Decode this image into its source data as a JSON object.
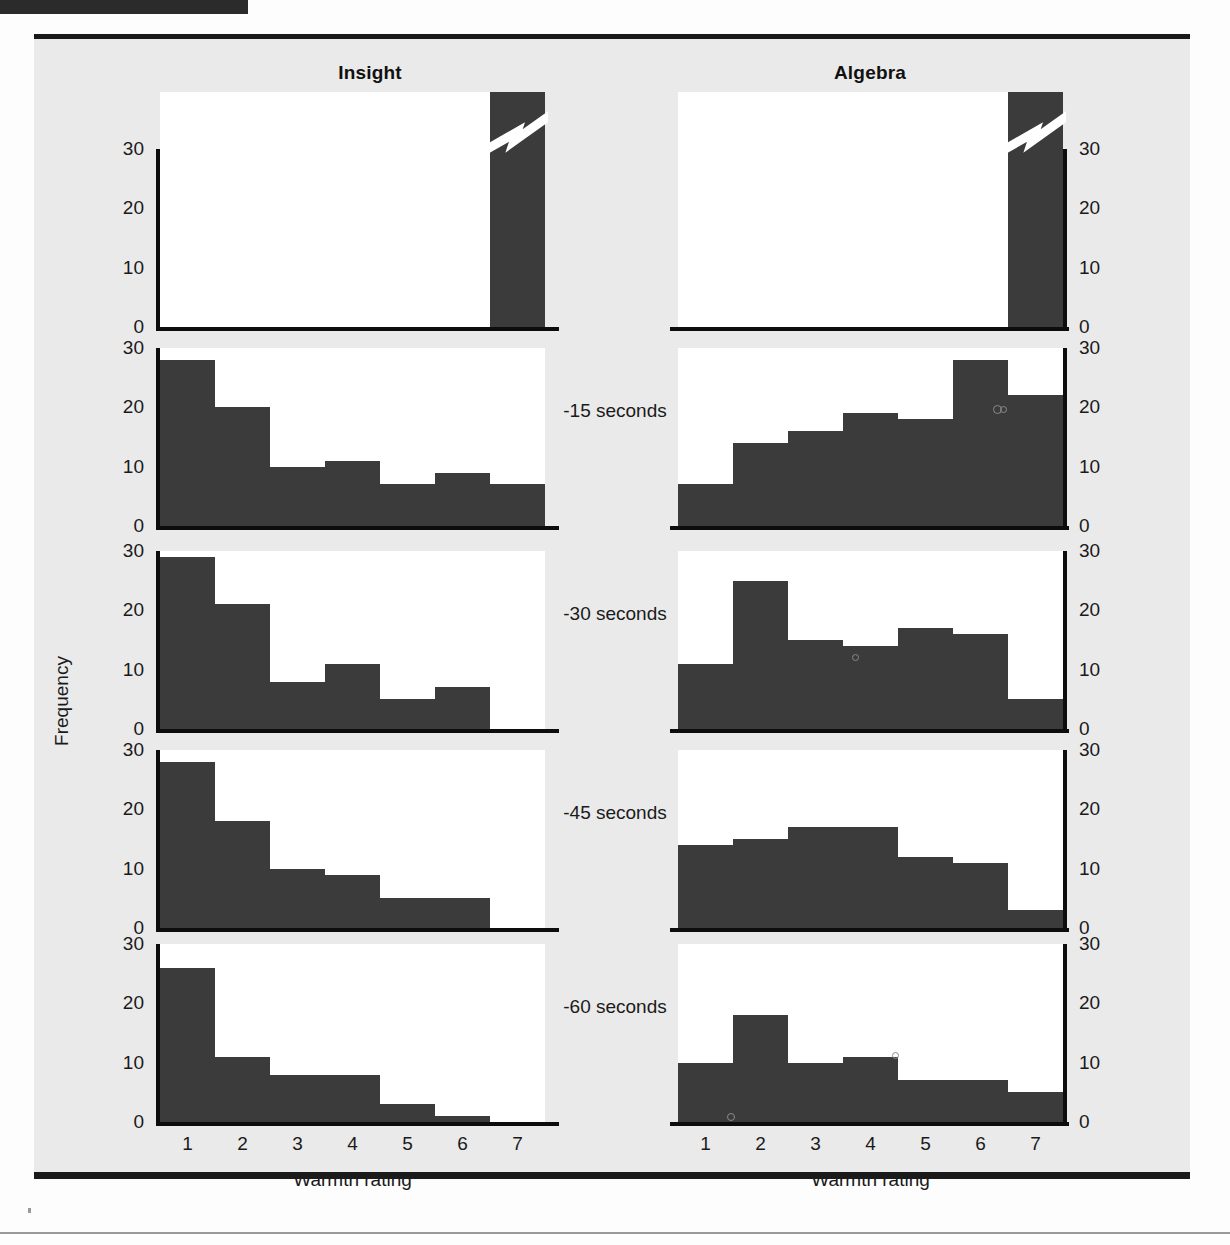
{
  "figure": {
    "columns": [
      "Insight",
      "Algebra"
    ],
    "y_axis_label": "Frequency",
    "x_axis_label": "Warmth rating",
    "x_ticks": [
      "1",
      "2",
      "3",
      "4",
      "5",
      "6",
      "7"
    ],
    "y_ticks": [
      "0",
      "10",
      "20",
      "30"
    ],
    "row_labels": [
      "",
      "-15 seconds",
      "-30 seconds",
      "-45 seconds",
      "-60 seconds"
    ],
    "bar_color": "#3b3b3b",
    "axis_color": "#0d0d0d",
    "background_color": "#eaeaea",
    "panel_color": "#ffffff"
  },
  "chart_data": {
    "type": "bar",
    "title": "",
    "xlabel": "Warmth rating",
    "ylabel": "Frequency",
    "categories": [
      "1",
      "2",
      "3",
      "4",
      "5",
      "6",
      "7"
    ],
    "ylim": [
      0,
      30
    ],
    "grid": false,
    "legend": "none",
    "note": "Small-multiple histograms; top row y-axis is broken (zigzag) because bar 7 exceeds the scale.",
    "panels": [
      {
        "column": "Insight",
        "row_label": "",
        "broken_axis": true,
        "values": [
          0,
          0,
          0,
          0,
          0,
          0,
          44
        ],
        "displayed_height_note": "bar 7 clipped above break"
      },
      {
        "column": "Algebra",
        "row_label": "",
        "broken_axis": true,
        "values": [
          0,
          0,
          0,
          0,
          0,
          0,
          44
        ],
        "displayed_height_note": "bar 7 clipped above break"
      },
      {
        "column": "Insight",
        "row_label": "-15 seconds",
        "broken_axis": false,
        "values": [
          28,
          20,
          10,
          11,
          7,
          9,
          7
        ]
      },
      {
        "column": "Algebra",
        "row_label": "-15 seconds",
        "broken_axis": false,
        "values": [
          7,
          14,
          16,
          19,
          18,
          28,
          22
        ]
      },
      {
        "column": "Insight",
        "row_label": "-30 seconds",
        "broken_axis": false,
        "values": [
          29,
          21,
          8,
          11,
          5,
          7,
          0
        ]
      },
      {
        "column": "Algebra",
        "row_label": "-30 seconds",
        "broken_axis": false,
        "values": [
          11,
          25,
          15,
          14,
          17,
          16,
          5
        ]
      },
      {
        "column": "Insight",
        "row_label": "-45 seconds",
        "broken_axis": false,
        "values": [
          28,
          18,
          10,
          9,
          5,
          5,
          0
        ]
      },
      {
        "column": "Algebra",
        "row_label": "-45 seconds",
        "broken_axis": false,
        "values": [
          14,
          15,
          17,
          17,
          12,
          11,
          3
        ]
      },
      {
        "column": "Insight",
        "row_label": "-60 seconds",
        "broken_axis": false,
        "values": [
          26,
          11,
          8,
          8,
          3,
          1,
          0
        ]
      },
      {
        "column": "Algebra",
        "row_label": "-60 seconds",
        "broken_axis": false,
        "values": [
          10,
          18,
          10,
          11,
          7,
          7,
          5
        ]
      }
    ]
  }
}
